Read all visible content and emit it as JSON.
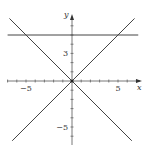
{
  "chart_data": {
    "type": "line",
    "title": "",
    "xlabel": "x",
    "ylabel": "y",
    "xlim": [
      -7.2,
      7.6
    ],
    "ylim": [
      -7,
      7.2
    ],
    "grid": false,
    "legend": null,
    "x_tick_step": 1,
    "y_tick_step": 1,
    "x_tick_labels": [
      {
        "value": -5,
        "label": "−5"
      },
      {
        "value": 5,
        "label": "5"
      }
    ],
    "y_tick_labels": [
      {
        "value": 3,
        "label": "3"
      },
      {
        "value": -5,
        "label": "−5"
      }
    ],
    "series": [
      {
        "name": "y = 5",
        "x": [
          -7,
          7.2
        ],
        "y": [
          5,
          5
        ]
      },
      {
        "name": "y = x",
        "x": [
          -6.5,
          6.8
        ],
        "y": [
          -6.5,
          6.8
        ]
      },
      {
        "name": "y = -x",
        "x": [
          -6.8,
          6.5
        ],
        "y": [
          6.8,
          -6.5
        ]
      }
    ],
    "colors": {
      "line": "#444444",
      "axis": "#555555",
      "background": "#ffffff"
    }
  }
}
